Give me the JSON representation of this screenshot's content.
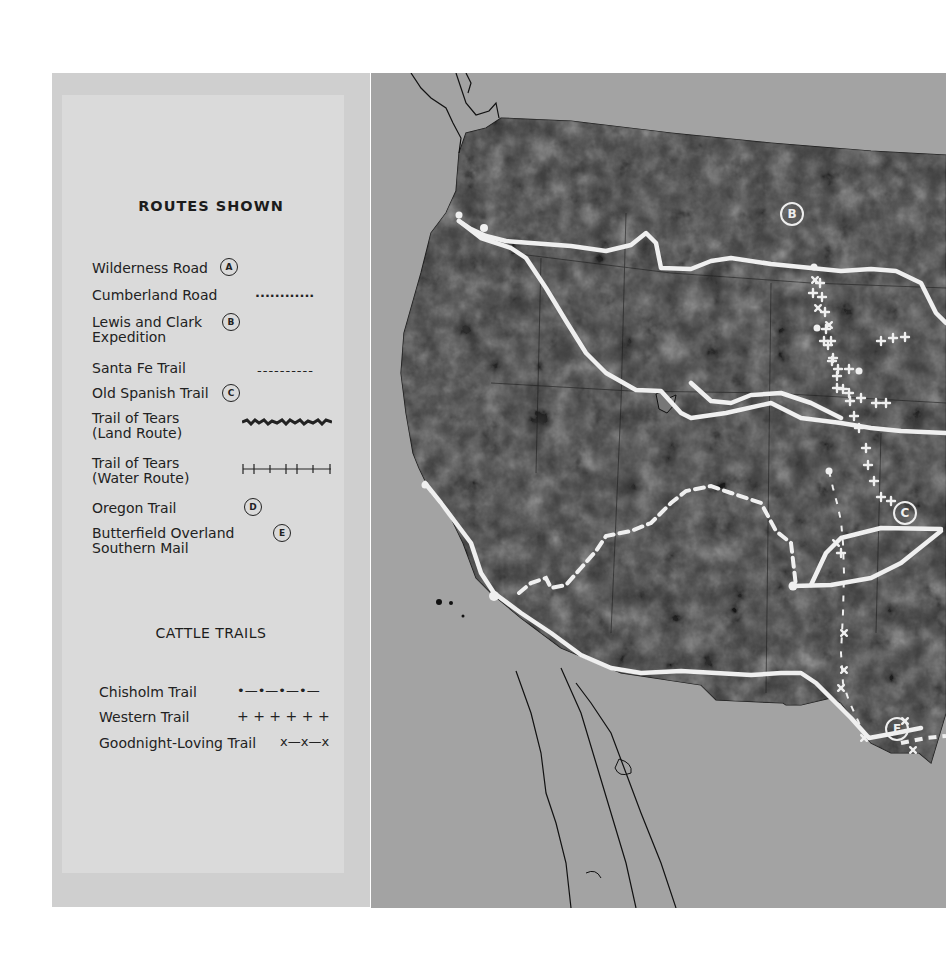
{
  "legend": {
    "routes_title": "ROUTES SHOWN",
    "routes": [
      {
        "label": "Wilderness Road",
        "symbol": "A",
        "symbol_type": "circle-letter"
      },
      {
        "label": "Cumberland Road",
        "symbol": "............",
        "symbol_type": "dotted-line"
      },
      {
        "label": "Lewis and Clark",
        "label2": "Expedition",
        "symbol": "B",
        "symbol_type": "circle-letter"
      },
      {
        "label": "Santa Fe Trail",
        "symbol": "----------",
        "symbol_type": "dashed-line"
      },
      {
        "label": "Old Spanish Trail",
        "symbol": "C",
        "symbol_type": "circle-letter"
      },
      {
        "label": "Trail of Tears",
        "label2": "(Land Route)",
        "symbol": "rough-line",
        "symbol_type": "rough-line"
      },
      {
        "label": "Trail of Tears",
        "label2": "(Water Route)",
        "symbol": "H–I–I–I–I–I",
        "symbol_type": "tick-line"
      },
      {
        "label": "Oregon Trail",
        "symbol": "D",
        "symbol_type": "circle-letter"
      },
      {
        "label": "Butterfield Overland",
        "label2": "Southern Mail",
        "symbol": "E",
        "symbol_type": "circle-letter"
      }
    ],
    "cattle_title": "CATTLE TRAILS",
    "cattle": [
      {
        "label": "Chisholm Trail",
        "symbol": "•—•—•—•—"
      },
      {
        "label": "Western Trail",
        "symbol": "+ + + + + +"
      },
      {
        "label": "Goodnight-Loving Trail",
        "symbol": "x—x—x"
      }
    ]
  },
  "map": {
    "markers": [
      {
        "letter": "B",
        "x": 409,
        "y": 129
      },
      {
        "letter": "C",
        "x": 522,
        "y": 428
      },
      {
        "letter": "E",
        "x": 514,
        "y": 653
      }
    ],
    "colors": {
      "land": "#3a3a3a",
      "water": "#a3a3a3",
      "route": "#efefef"
    }
  }
}
